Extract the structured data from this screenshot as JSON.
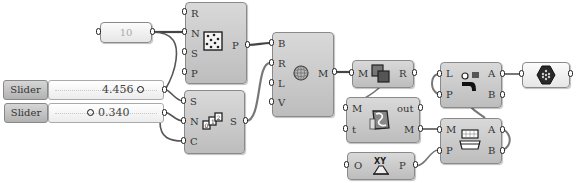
{
  "canvas": {
    "background": "#ffffff",
    "wire_color": "#555555"
  },
  "panel": {
    "value": "10"
  },
  "sliders": [
    {
      "label": "Slider",
      "value": "4.456",
      "knob_position": "right"
    },
    {
      "label": "Slider",
      "value": "0.340",
      "knob_position": "left"
    }
  ],
  "nodes": {
    "populate": {
      "icon": "populate-points-icon",
      "inputs": [
        "R",
        "N",
        "S",
        "P"
      ],
      "outputs": [
        "P"
      ]
    },
    "series": {
      "icon": "series-icon",
      "inputs": [
        "S",
        "N",
        "C"
      ],
      "outputs": [
        "S"
      ]
    },
    "mesh": {
      "icon": "mesh-sphere-icon",
      "inputs": [
        "B",
        "R",
        "L",
        "V"
      ],
      "outputs": [
        "M"
      ]
    },
    "boolean": {
      "icon": "mesh-union-icon",
      "inputs": [
        "M"
      ],
      "outputs": [
        "R"
      ]
    },
    "smooth": {
      "icon": "smooth-mesh-icon",
      "inputs": [
        "M",
        "t"
      ],
      "outputs": [
        "out",
        "M"
      ]
    },
    "xyplane": {
      "icon": "xy-plane-icon",
      "inputs": [
        "O"
      ],
      "outputs": [
        "P"
      ]
    },
    "split": {
      "icon": "split-mesh-icon",
      "inputs": [
        "L",
        "P"
      ],
      "outputs": [
        "A",
        "B"
      ]
    },
    "dispatch": {
      "icon": "split-box-icon",
      "inputs": [
        "M",
        "P"
      ],
      "outputs": [
        "A",
        "B"
      ]
    },
    "output": {
      "icon": "hexagon-mesh-icon"
    }
  }
}
